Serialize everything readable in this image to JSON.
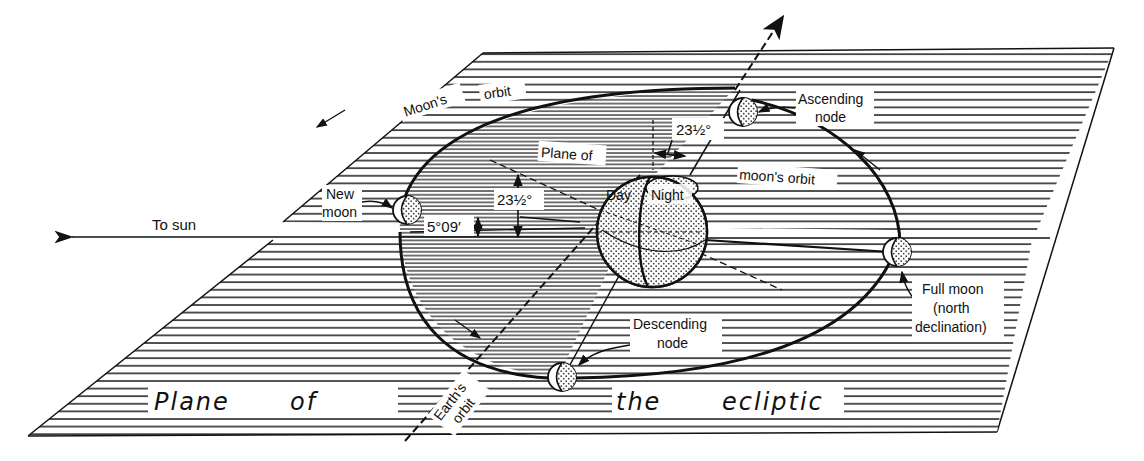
{
  "diagram": {
    "type": "astronomy-geometry",
    "colors": {
      "ink": "#111111",
      "background": "#ffffff",
      "hatch": "#2a2a2a",
      "stipple": "#444444"
    },
    "labels": {
      "to_sun": "To sun",
      "moons_orbit_upper_1": "Moon's",
      "moons_orbit_upper_2": "orbit",
      "moons_orbit_right": "moon's orbit",
      "plane_of_inner": "Plane of",
      "angle_tilt_inner": "23½°",
      "angle_tilt_top": "23½°",
      "angle_inclination": "5°09′",
      "new_moon_1": "New",
      "new_moon_2": "moon",
      "ascending_node_1": "Ascending",
      "ascending_node_2": "node",
      "descending_node_1": "Descending",
      "descending_node_2": "node",
      "full_moon_1": "Full moon",
      "full_moon_2": "(north",
      "full_moon_3": "declination)",
      "day": "Day",
      "night": "Night",
      "earths_orbit_1": "Earth's",
      "earths_orbit_2": "orbit",
      "plane_of_ecliptic_1": "Plane",
      "plane_of_ecliptic_2": "of",
      "plane_of_ecliptic_3": "the",
      "plane_of_ecliptic_4": "ecliptic"
    },
    "bodies": [
      {
        "name": "Earth",
        "phase_labels": [
          "Day",
          "Night"
        ]
      },
      {
        "name": "New moon"
      },
      {
        "name": "Ascending node moon"
      },
      {
        "name": "Descending node moon"
      },
      {
        "name": "Full moon (north declination)"
      }
    ],
    "angles": [
      {
        "label": "5°09′",
        "meaning": "inclination of moon's orbit to ecliptic"
      },
      {
        "label": "23½°",
        "meaning": "tilt of Earth's axis (inner)"
      },
      {
        "label": "23½°",
        "meaning": "tilt of Earth's axis (top)"
      }
    ]
  }
}
